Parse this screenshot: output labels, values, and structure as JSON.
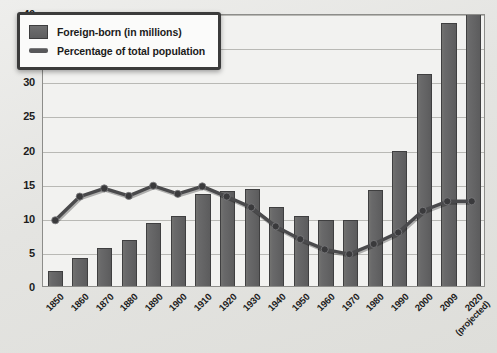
{
  "legend": {
    "position": "top-left",
    "items": [
      {
        "marker": "bar-swatch-icon",
        "label": "Foreign-born (in millions)"
      },
      {
        "marker": "line-swatch-icon",
        "label": "Percentage of total population"
      }
    ]
  },
  "axis": {
    "y_ticks": [
      "0",
      "5",
      "10",
      "15",
      "20",
      "25",
      "30",
      "35",
      "40"
    ],
    "x_tick_sub": "(projected)"
  },
  "colors": {
    "bar_fill": "#646465",
    "bar_stroke": "#3f3f40",
    "line": "#4a4a4c",
    "marker": "#3a3a3c",
    "plot_background": "#f2f2f0",
    "page_background": "#e6e6e3",
    "gridline": "#b9b9b5",
    "text": "#1d1d1d"
  },
  "chart_data": {
    "type": "bar",
    "title": "",
    "subtitle": "",
    "xlabel": "",
    "ylabel": "",
    "ylim": [
      0,
      40
    ],
    "ytick_step": 5,
    "grid": true,
    "legend_position": "top-left",
    "categories": [
      "1850",
      "1860",
      "1870",
      "1880",
      "1890",
      "1900",
      "1910",
      "1920",
      "1930",
      "1940",
      "1950",
      "1960",
      "1970",
      "1980",
      "1990",
      "2000",
      "2009",
      "2020"
    ],
    "category_notes": {
      "2020": "(projected)"
    },
    "series": [
      {
        "name": "Foreign-born (in millions)",
        "type": "bar",
        "values": [
          2.2,
          4.1,
          5.6,
          6.7,
          9.2,
          10.3,
          13.5,
          13.9,
          14.2,
          11.6,
          10.3,
          9.7,
          9.6,
          14.1,
          19.8,
          31.1,
          38.5,
          40.0
        ]
      },
      {
        "name": "Percentage of total population",
        "type": "line",
        "values": [
          9.7,
          13.2,
          14.4,
          13.3,
          14.8,
          13.6,
          14.7,
          13.2,
          11.6,
          8.8,
          6.9,
          5.4,
          4.7,
          6.2,
          7.9,
          11.1,
          12.5,
          12.5
        ]
      }
    ]
  }
}
